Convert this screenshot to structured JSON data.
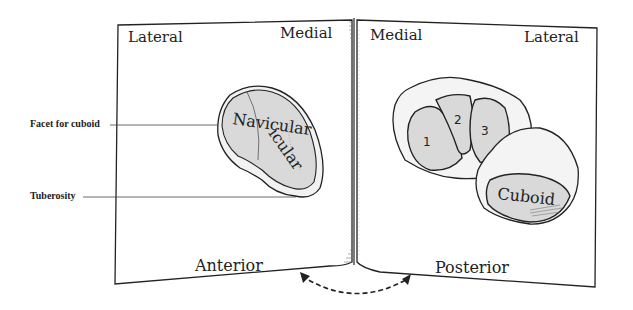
{
  "figure": {
    "type": "anatomical-illustration"
  },
  "left_page": {
    "view_label": "Anterior",
    "corner_left": "Lateral",
    "corner_right": "Medial",
    "bone_label": "Navicular",
    "callouts": [
      {
        "label": "Facet for cuboid"
      },
      {
        "label": "Tuberosity"
      }
    ]
  },
  "right_page": {
    "view_label": "Posterior",
    "corner_left": "Medial",
    "corner_right": "Lateral",
    "bones": [
      {
        "label": "1"
      },
      {
        "label": "2"
      },
      {
        "label": "3"
      },
      {
        "label": "Cuboid"
      }
    ]
  },
  "arrow": {
    "style": "dashed",
    "direction": "bidirectional"
  },
  "colors": {
    "ink": "#222222",
    "bone_fill": "#d9d9d9",
    "paper": "#ffffff"
  }
}
